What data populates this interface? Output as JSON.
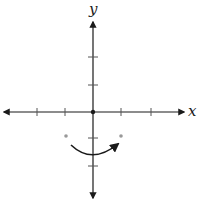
{
  "diagram": {
    "x_axis_label": "x",
    "y_axis_label": "y",
    "origin": {
      "x": 93,
      "y": 112
    },
    "tick_spacing_px": 28,
    "x_ticks": [
      -2,
      -1,
      1,
      2
    ],
    "y_ticks": [
      -2,
      -1,
      1,
      2
    ],
    "colors": {
      "axis": "#1a1a1a",
      "curve": "#1a1a1a",
      "marker_points": "#999999",
      "background": "#ffffff"
    },
    "marker_points": [
      {
        "x": -1,
        "y": -0.85
      },
      {
        "x": 1,
        "y": -0.85
      }
    ],
    "curve": {
      "type": "arc-with-arrow",
      "description": "downward-opening-concave-up arc below origin, arrow at right end",
      "start": {
        "x": -0.8,
        "y": -1.2
      },
      "vertex": {
        "x": 0,
        "y": -1.5
      },
      "end": {
        "x": 0.9,
        "y": -1.1
      }
    }
  }
}
